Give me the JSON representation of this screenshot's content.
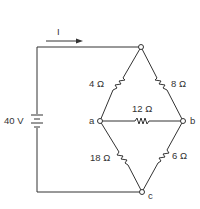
{
  "diagram": {
    "type": "circuit",
    "current_label": "I",
    "source": {
      "label": "40 V",
      "value_v": 40
    },
    "nodes": [
      {
        "id": "top",
        "label": ""
      },
      {
        "id": "a",
        "label": "a"
      },
      {
        "id": "b",
        "label": "b"
      },
      {
        "id": "c",
        "label": "c"
      }
    ],
    "resistors": [
      {
        "id": "R1",
        "label": "4 Ω",
        "ohms": 4,
        "from": "top",
        "to": "a"
      },
      {
        "id": "R2",
        "label": "8 Ω",
        "ohms": 8,
        "from": "top",
        "to": "b"
      },
      {
        "id": "R3",
        "label": "12 Ω",
        "ohms": 12,
        "from": "a",
        "to": "b"
      },
      {
        "id": "R4",
        "label": "18 Ω",
        "ohms": 18,
        "from": "a",
        "to": "c"
      },
      {
        "id": "R5",
        "label": "6 Ω",
        "ohms": 6,
        "from": "b",
        "to": "c"
      }
    ]
  }
}
